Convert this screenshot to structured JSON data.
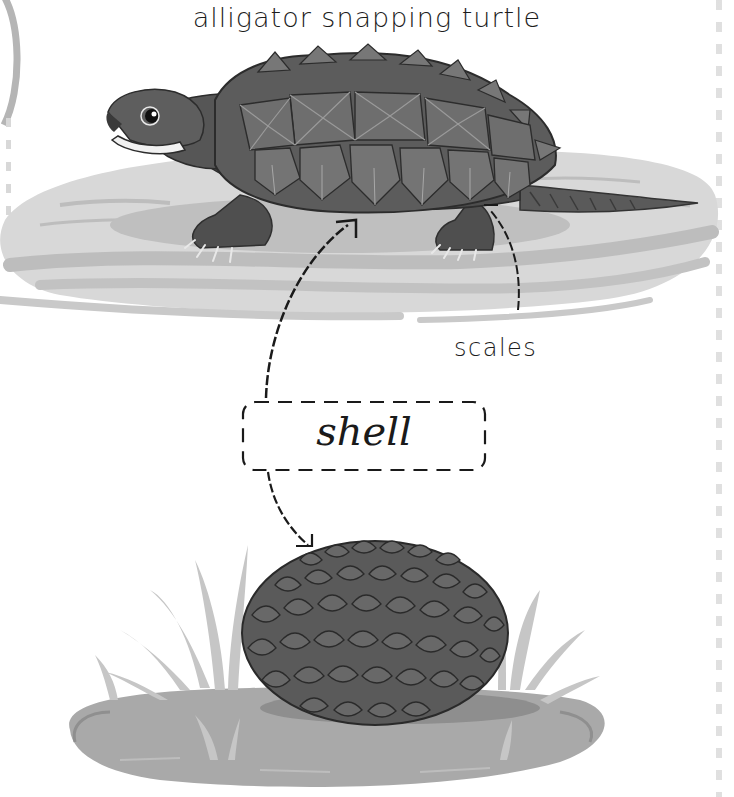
{
  "page": {
    "title": "alligator snapping turtle",
    "labels": {
      "scales": "scales",
      "shell": "shell"
    }
  },
  "illustrations": [
    {
      "name": "alligator-snapping-turtle",
      "description": "alligator snapping turtle standing on a grey water patch"
    },
    {
      "name": "pangolin-curled",
      "description": "pangolin curled into a scaly ball on grassy ground"
    }
  ],
  "colors": {
    "background": "#ffffff",
    "text": "#1c1c1c",
    "turtle_dark": "#4a4a4a",
    "turtle_mid": "#6b6b6b",
    "water": "#d6d6d6",
    "water_stripe": "#bcbcbc",
    "pangolin": "#555555",
    "ground": "#a8a8a8",
    "grass": "#c4c4c4"
  }
}
